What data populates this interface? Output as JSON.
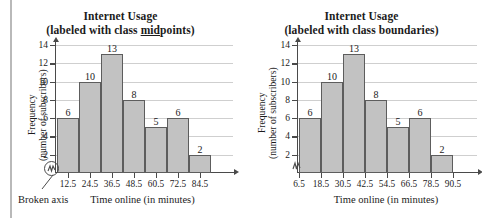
{
  "annotations": {
    "broken_axis_label": "Broken axis",
    "broken_axis_icon": "axis-break-squiggle-icon"
  },
  "chart_data": [
    {
      "id": "midpoints",
      "type": "bar",
      "title": "Internet Usage",
      "subtitle": "(labeled with class midpoints)",
      "subtitle_pre": "(labeled with class ",
      "subtitle_emph": "mid",
      "subtitle_post": "points)",
      "xlabel": "Time online (in minutes)",
      "ylabel": "Frequency",
      "ylabel2": "(number of subscribers)",
      "label_mode": "class midpoints",
      "categories": [
        "12.5",
        "24.5",
        "36.5",
        "48.5",
        "60.5",
        "72.5",
        "84.5"
      ],
      "values": [
        6,
        10,
        13,
        8,
        5,
        6,
        2
      ],
      "bar_labels": [
        "6",
        "10",
        "13",
        "8",
        "5",
        "6",
        "2"
      ],
      "yticks": [
        2,
        4,
        6,
        8,
        10,
        12,
        14
      ],
      "ytick_labels": [
        "2",
        "4",
        "6",
        "8",
        "10",
        "12",
        "14"
      ],
      "ylim": [
        0,
        14
      ],
      "xtick_labels": [
        "12.5",
        "24.5",
        "36.5",
        "48.5",
        "60.5",
        "72.5",
        "84.5"
      ],
      "grid": true,
      "legend": "none",
      "bar_fill": "#c2c2c2",
      "bar_edge": "#5d5d5d",
      "grid_color": "#cfcfcf",
      "axis_color": "#4a4a4a",
      "broken_axis": true
    },
    {
      "id": "boundaries",
      "type": "bar",
      "title": "Internet Usage",
      "subtitle": "(labeled with class boundaries)",
      "subtitle_pre": "(labeled with class ",
      "subtitle_emph": "",
      "subtitle_post": "boundaries)",
      "xlabel": "Time online (in minutes)",
      "ylabel": "Frequency",
      "ylabel2": "(number of subscribers)",
      "label_mode": "class boundaries",
      "categories": [
        "6.5-18.5",
        "18.5-30.5",
        "30.5-42.5",
        "42.5-54.5",
        "54.5-66.5",
        "66.5-78.5",
        "78.5-90.5"
      ],
      "values": [
        6,
        10,
        13,
        8,
        5,
        6,
        2
      ],
      "bar_labels": [
        "6",
        "10",
        "13",
        "8",
        "5",
        "6",
        "2"
      ],
      "yticks": [
        2,
        4,
        6,
        8,
        10,
        12,
        14
      ],
      "ytick_labels": [
        "2",
        "4",
        "6",
        "8",
        "10",
        "12",
        "14"
      ],
      "ylim": [
        0,
        14
      ],
      "xtick_labels": [
        "6.5",
        "18.5",
        "30.5",
        "42.5",
        "54.5",
        "66.5",
        "78.5",
        "90.5"
      ],
      "boundaries": [
        6.5,
        18.5,
        30.5,
        42.5,
        54.5,
        66.5,
        78.5,
        90.5
      ],
      "grid": true,
      "legend": "none",
      "bar_fill": "#c2c2c2",
      "bar_edge": "#5d5d5d",
      "grid_color": "#cfcfcf",
      "axis_color": "#4a4a4a",
      "broken_axis": true
    }
  ]
}
